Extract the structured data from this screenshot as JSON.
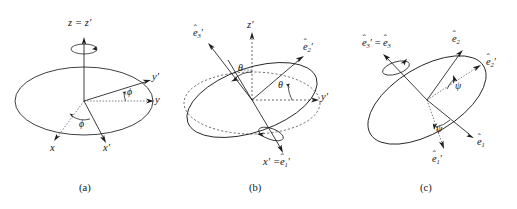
{
  "figure": {
    "kind": "euler-angle-rotation-diagram",
    "background_color": "#ffffff",
    "line_color": "#1c1c1c",
    "panels": [
      {
        "id": "a",
        "caption": "(a)",
        "rotation_angle_symbol": "ϕ",
        "axis_labels": {
          "vertical": "z",
          "vertical_prime": "z′",
          "vertical_combined": "z = z′",
          "right_plain": "y",
          "right_prime": "y′",
          "lower_left_plain": "x",
          "lower_right_prime": "x′"
        },
        "angle_labels": [
          "ϕ",
          "ϕ"
        ],
        "spin_arrow": "about z axis"
      },
      {
        "id": "b",
        "caption": "(b)",
        "rotation_angle_symbol": "θ",
        "axis_labels": {
          "vertical_prime": "z′",
          "right_prime": "y′",
          "upper_left_unit": "e",
          "upper_left_sub": "3",
          "upper_right_unit": "e",
          "upper_right_sub": "2",
          "bottom_combined_left": "x′",
          "bottom_combined_unit": "e",
          "bottom_combined_sub": "1"
        },
        "angle_labels": [
          "θ",
          "θ"
        ],
        "spin_arrow": "about x′ axis"
      },
      {
        "id": "c",
        "caption": "(c)",
        "rotation_angle_symbol": "ψ",
        "axis_labels": {
          "top_left_unit": "e",
          "top_left_sub": "3",
          "top_right_unit": "e",
          "top_right_sub": "2",
          "right_prime_unit": "e",
          "right_prime_sub": "2",
          "lower_right_unit": "e",
          "lower_right_sub": "1",
          "bottom_prime_unit": "e",
          "bottom_prime_sub": "1"
        },
        "angle_labels": [
          "ψ",
          "ψ"
        ],
        "spin_arrow": "about e3 axis"
      }
    ]
  },
  "labels": {
    "a": {
      "z_eq_zprime": "z = z′",
      "y_prime": "y′",
      "y": "y",
      "x": "x",
      "x_prime": "x′",
      "phi_upper": "ϕ",
      "phi_lower": "ϕ",
      "caption": "(a)"
    },
    "b": {
      "z_prime": "z′",
      "y_prime": "y′",
      "e3_prime": "e",
      "e3_prime_sub": "3",
      "e2_prime": "e",
      "e2_prime_sub": "2",
      "xprime_eq": "x′ =",
      "e1_prime": "e",
      "e1_prime_sub": "1",
      "theta_upper": "θ",
      "theta_lower": "θ",
      "caption": "(b)"
    },
    "c": {
      "e3_prime_eq": "e",
      "e3_prime_eq_sub": "3",
      "e3": "e",
      "e3_sub": "3",
      "e2": "e",
      "e2_sub": "2",
      "e2_prime": "e",
      "e2_prime_sub": "2",
      "e1": "e",
      "e1_sub": "1",
      "e1_prime": "e",
      "e1_prime_sub": "1",
      "psi_upper": "ψ",
      "psi_lower": "ψ",
      "caption": "(c)"
    }
  },
  "glyphs": {
    "hat": "ˆ",
    "prime": "′",
    "equals": "="
  }
}
